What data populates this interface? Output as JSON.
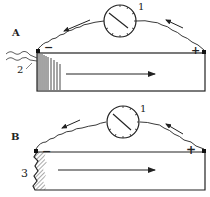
{
  "figure": {
    "panels": [
      {
        "id": "A",
        "label": "A",
        "meter_label": "1",
        "electrode_label": "2",
        "negative_sign": "−",
        "positive_sign": "+",
        "description": "galvanometer connected across bar; striated end at negative terminal; arrow pointing right"
      },
      {
        "id": "B",
        "label": "B",
        "meter_label": "1",
        "electrode_label": "3",
        "negative_sign": "−",
        "positive_sign": "+",
        "description": "galvanometer connected across bar; injured (hatched, jagged) end at negative terminal; arrow pointing right"
      }
    ],
    "colors": {
      "ink": "#222222",
      "background": "#ffffff"
    }
  }
}
